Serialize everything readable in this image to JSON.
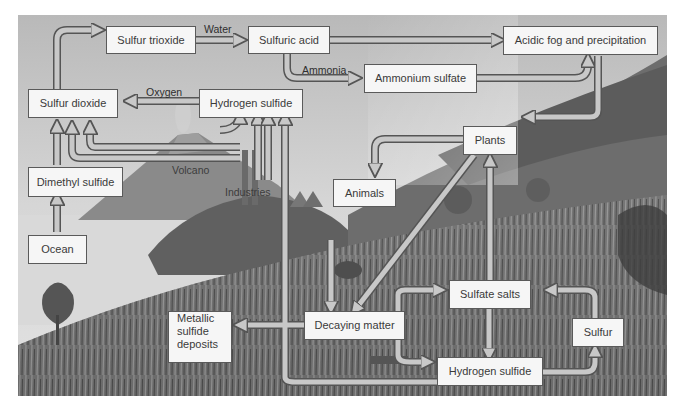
{
  "diagram": {
    "style": "grayscale illustration",
    "colors": {
      "box_fill": "#f6f6f6",
      "box_border": "#5a5a5a",
      "arrow_fill": "#c8c8c8",
      "arrow_outline": "#555555",
      "text": "#3a3a3a"
    },
    "nodes": {
      "sulfur_trioxide": "Sulfur trioxide",
      "sulfuric_acid": "Sulfuric acid",
      "acidic_fog": "Acidic fog and precipitation",
      "ammonium_sulfate": "Ammonium sulfate",
      "sulfur_dioxide": "Sulfur dioxide",
      "hydrogen_sulfide_top": "Hydrogen sulfide",
      "plants": "Plants",
      "animals": "Animals",
      "dimethyl_sulfide": "Dimethyl sulfide",
      "ocean": "Ocean",
      "metallic_sulfide_deposits": [
        "Metallic",
        "sulfide",
        "deposits"
      ],
      "decaying_matter": "Decaying matter",
      "sulfate_salts": "Sulfate salts",
      "sulfur": "Sulfur",
      "hydrogen_sulfide_bottom": "Hydrogen sulfide"
    },
    "arrow_labels": {
      "water": "Water",
      "ammonia": "Ammonia",
      "oxygen": "Oxygen"
    },
    "scene_labels": {
      "volcano": "Volcano",
      "industries": "Industries"
    },
    "edges": [
      {
        "from": "Sulfur dioxide",
        "to": "Sulfur trioxide"
      },
      {
        "from": "Sulfur trioxide",
        "to": "Sulfuric acid",
        "label": "Water"
      },
      {
        "from": "Sulfuric acid",
        "to": "Acidic fog and precipitation"
      },
      {
        "from": "Sulfuric acid",
        "to": "Ammonium sulfate",
        "label": "Ammonia"
      },
      {
        "from": "Ammonium sulfate",
        "to": "Acidic fog and precipitation"
      },
      {
        "from": "Acidic fog and precipitation",
        "to": "Plants"
      },
      {
        "from": "Hydrogen sulfide",
        "to": "Sulfur dioxide",
        "label": "Oxygen"
      },
      {
        "from": "Dimethyl sulfide",
        "to": "Sulfur dioxide"
      },
      {
        "from": "Ocean",
        "to": "Dimethyl sulfide"
      },
      {
        "from": "Volcano",
        "to": "Sulfur dioxide"
      },
      {
        "from": "Volcano",
        "to": "Hydrogen sulfide"
      },
      {
        "from": "Industries",
        "to": "Sulfur dioxide"
      },
      {
        "from": "Industries",
        "to": "Hydrogen sulfide"
      },
      {
        "from": "Plants",
        "to": "Animals"
      },
      {
        "from": "Plants",
        "to": "Decaying matter"
      },
      {
        "from": "Animals",
        "to": "Decaying matter"
      },
      {
        "from": "Sulfate salts",
        "to": "Plants"
      },
      {
        "from": "Decaying matter",
        "to": "Metallic sulfide deposits"
      },
      {
        "from": "Decaying matter",
        "to": "Sulfate salts"
      },
      {
        "from": "Decaying matter",
        "to": "Hydrogen sulfide (bottom)"
      },
      {
        "from": "Sulfate salts",
        "to": "Hydrogen sulfide (bottom)"
      },
      {
        "from": "Hydrogen sulfide (bottom)",
        "to": "Sulfur"
      },
      {
        "from": "Sulfur",
        "to": "Sulfate salts"
      },
      {
        "from": "Hydrogen sulfide (bottom)",
        "to": "Hydrogen sulfide (top)"
      }
    ]
  }
}
